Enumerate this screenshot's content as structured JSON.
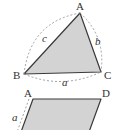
{
  "colors": {
    "fill": "#d3d3d3",
    "stroke": "#3a3a3a",
    "dashed": "#8a8a8a",
    "text": "#333333",
    "background": "#ffffff"
  },
  "triangle": {
    "vertices": {
      "A": "A",
      "B": "B",
      "C": "C"
    },
    "sides": {
      "a": "a",
      "b": "b",
      "c": "c"
    }
  },
  "parallelogram": {
    "vertices": {
      "A": "A",
      "D": "D"
    },
    "sides": {
      "a": "a"
    }
  }
}
